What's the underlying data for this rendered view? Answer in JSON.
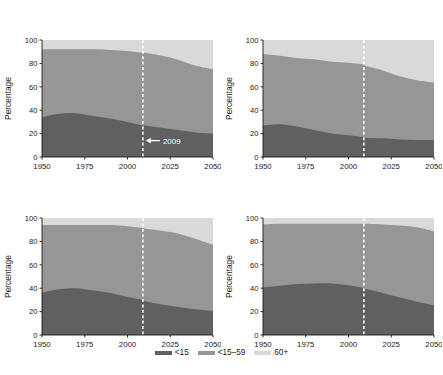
{
  "figure": {
    "background": "#ffffff",
    "axis_label": "Percentage",
    "yticks": [
      0,
      20,
      40,
      60,
      80,
      100
    ],
    "xticks": [
      1950,
      1975,
      2000,
      2025,
      2050
    ],
    "xlim": [
      1950,
      2050
    ],
    "ylim": [
      0,
      100
    ],
    "reference_year": 2009,
    "reference_line_color": "#ffffff",
    "annotation_text": "2009",
    "annotation_arrow": "left-arrow-icon"
  },
  "legend": {
    "position": "bottom-center",
    "items": [
      {
        "label": "<15",
        "color": "#606060",
        "swatch": "legend-swatch-under15"
      },
      {
        "label": "<15–59",
        "color": "#969696",
        "swatch": "legend-swatch-15to59"
      },
      {
        "label": "60+",
        "color": "#d9d9d9",
        "swatch": "legend-swatch-60plus"
      }
    ]
  },
  "colors": {
    "under15": "#606060",
    "age15to59": "#969696",
    "age60plus": "#d9d9d9",
    "axis": "#1a1a1a",
    "text": "#1a1a1a"
  },
  "chart_data": {
    "type": "area",
    "stacked": true,
    "xlabel": "",
    "ylabel": "Percentage",
    "xlim": [
      1950,
      2050
    ],
    "ylim": [
      0,
      100
    ],
    "xticks": [
      1950,
      1975,
      2000,
      2025,
      2050
    ],
    "yticks": [
      0,
      20,
      40,
      60,
      80,
      100
    ],
    "grid": false,
    "legend_position": "bottom-center",
    "annotations": [
      {
        "panel": "A. World",
        "text": "2009",
        "x": 2009,
        "y": 14,
        "type": "arrow-label"
      }
    ],
    "x": [
      1950,
      1960,
      1970,
      1980,
      1990,
      2000,
      2009,
      2010,
      2020,
      2030,
      2040,
      2050
    ],
    "panels": [
      {
        "id": "A",
        "title": "A. World",
        "series": [
          {
            "name": "<15",
            "color": "#606060",
            "values": [
              34,
              37,
              37.5,
              35,
              33,
              30,
              27,
              27,
              25,
              23,
              21,
              20
            ]
          },
          {
            "name": "<15–59",
            "color": "#969696",
            "values": [
              58,
              55,
              54.5,
              57,
              58.5,
              60.5,
              62,
              62,
              61.5,
              60,
              57,
              55
            ]
          },
          {
            "name": "60+",
            "color": "#d9d9d9",
            "values": [
              8,
              8,
              8,
              8,
              8.5,
              9.5,
              11,
              11,
              13.5,
              17,
              22,
              25
            ]
          }
        ]
      },
      {
        "id": "B",
        "title": "B. More developed regions",
        "series": [
          {
            "name": "<15",
            "color": "#606060",
            "values": [
              27,
              28,
              26,
              23,
              20,
              18.5,
              17,
              16.5,
              16,
              15,
              14.5,
              14.5
            ]
          },
          {
            "name": "<15–59",
            "color": "#969696",
            "values": [
              61,
              58.5,
              58.5,
              60.5,
              61.5,
              62,
              62,
              61.5,
              58,
              54,
              51,
              49
            ]
          },
          {
            "name": "60+",
            "color": "#d9d9d9",
            "values": [
              12,
              13.5,
              15.5,
              16.5,
              18.5,
              19.5,
              21,
              22,
              26,
              31,
              34.5,
              36.5
            ]
          }
        ]
      },
      {
        "id": "C",
        "title": "C. Less developed regions",
        "series": [
          {
            "name": "<15",
            "color": "#606060",
            "values": [
              36,
              39,
              40,
              38,
              36,
              32.5,
              30,
              29,
              26,
              24,
              22,
              20.5
            ]
          },
          {
            "name": "<15–59",
            "color": "#969696",
            "values": [
              58,
              55,
              54,
              56,
              58,
              60.5,
              61.5,
              62,
              63,
              62.5,
              60,
              56.5
            ]
          },
          {
            "name": "60+",
            "color": "#d9d9d9",
            "values": [
              6,
              6,
              6,
              6,
              6,
              7,
              8.5,
              9,
              11,
              13.5,
              18,
              23
            ]
          }
        ]
      },
      {
        "id": "D",
        "title": "D. Least developed countries",
        "series": [
          {
            "name": "<15",
            "color": "#606060",
            "values": [
              40.5,
              42,
              43.5,
              44,
              44,
              42.5,
              40,
              39.5,
              36,
              32,
              28.5,
              25.5
            ]
          },
          {
            "name": "<15–59",
            "color": "#969696",
            "values": [
              54,
              53,
              51.5,
              51,
              51,
              52.5,
              55,
              55.5,
              58.5,
              61.5,
              63.5,
              63
            ]
          },
          {
            "name": "60+",
            "color": "#d9d9d9",
            "values": [
              5.5,
              5,
              5,
              5,
              5,
              5,
              5,
              5,
              5.5,
              6.5,
              8,
              11.5
            ]
          }
        ]
      }
    ]
  }
}
